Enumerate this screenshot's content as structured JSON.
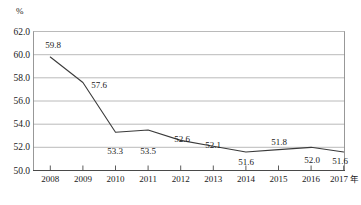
{
  "chart_data": {
    "type": "line",
    "title": "",
    "subtitle": "",
    "xlabel": "年",
    "ylabel": "%",
    "categories": [
      "2008",
      "2009",
      "2010",
      "2011",
      "2012",
      "2013",
      "2014",
      "2015",
      "2016",
      "2017"
    ],
    "values": [
      59.8,
      57.6,
      53.3,
      53.5,
      52.6,
      52.1,
      51.6,
      51.8,
      52.0,
      51.6
    ],
    "point_labels": [
      "59.8",
      "57.6",
      "53.3",
      "53.5",
      "52.6",
      "52.1",
      "51.6",
      "51.8",
      "52.0",
      "51.6"
    ],
    "label_positions": [
      "above",
      "below",
      "below",
      "below",
      "above",
      "above",
      "below",
      "above",
      "below",
      "below"
    ],
    "ylim": [
      50.0,
      62.0
    ],
    "ytick_labels": [
      "62.0",
      "60.0",
      "58.0",
      "56.0",
      "54.0",
      "52.0",
      "50.0"
    ],
    "ytick_values": [
      62.0,
      60.0,
      58.0,
      56.0,
      54.0,
      52.0,
      50.0
    ],
    "ystep": 2.0,
    "grid": true,
    "legend": "none",
    "series": [
      {
        "name": "",
        "values": [
          59.8,
          57.6,
          53.3,
          53.5,
          52.6,
          52.1,
          51.6,
          51.8,
          52.0,
          51.6
        ]
      }
    ],
    "colors": {
      "line": "#3a3a3a",
      "grid": "#a8a8a8",
      "axis": "#4a4a4a",
      "text": "#1a1a1a",
      "background": "#ffffff"
    }
  }
}
